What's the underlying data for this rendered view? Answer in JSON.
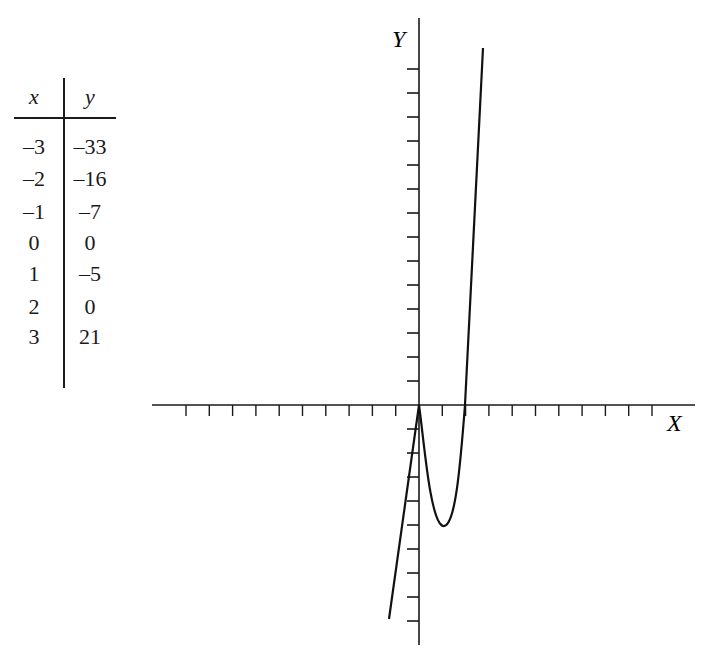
{
  "table": {
    "headers": {
      "x": "x",
      "y": "y"
    },
    "rows": [
      {
        "x": "–3",
        "y": "–33"
      },
      {
        "x": "–2",
        "y": "–16"
      },
      {
        "x": "–1",
        "y": "–7"
      },
      {
        "x": "0",
        "y": "0"
      },
      {
        "x": "1",
        "y": "–5"
      },
      {
        "x": "2",
        "y": "0"
      },
      {
        "x": "3",
        "y": "21"
      }
    ]
  },
  "axes": {
    "x_label": "X",
    "y_label": "Y"
  },
  "chart_data": {
    "type": "line",
    "title": "",
    "xlabel": "X",
    "ylabel": "Y",
    "x": [
      -3,
      -2,
      -1,
      0,
      1,
      2,
      3
    ],
    "series": [
      {
        "name": "y",
        "values": [
          -33,
          -16,
          -7,
          0,
          -5,
          0,
          21
        ]
      }
    ],
    "plotted_curve_points": [
      {
        "x": -1.29,
        "y": -8.9
      },
      {
        "x": 0,
        "y": 0
      },
      {
        "x": 1.0,
        "y": -5.0
      },
      {
        "x": 2.0,
        "y": 0
      },
      {
        "x": 2.75,
        "y": 14.8
      }
    ],
    "xlim": [
      -11,
      12
    ],
    "ylim": [
      -10,
      16
    ],
    "x_ticks_per_unit": 1,
    "y_ticks_per_unit": 1,
    "tick_labels": "none",
    "grid": false,
    "legend": "none",
    "annotations": [
      "Table of x and y values shown to the left of the graph"
    ]
  }
}
